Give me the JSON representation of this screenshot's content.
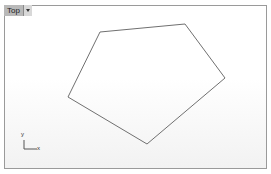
{
  "viewport": {
    "name": "Top",
    "menu_icon": "chevron-down-icon"
  },
  "shape": {
    "type": "pentagon",
    "stroke": "#707070",
    "points": [
      [
        100,
        32
      ],
      [
        185,
        24
      ],
      [
        225,
        78
      ],
      [
        147,
        144
      ],
      [
        68,
        97
      ]
    ]
  },
  "axes": {
    "x_label": "x",
    "y_label": "y"
  }
}
